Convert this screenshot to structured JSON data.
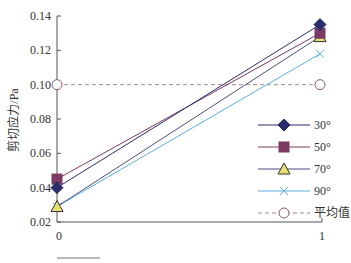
{
  "chart_data": {
    "type": "line",
    "title": "",
    "xlabel": "",
    "ylabel": "剪切应力/Pa",
    "x": [
      0,
      1
    ],
    "xticks": [
      "0",
      "1"
    ],
    "yticks": [
      "0.02",
      "0.04",
      "0.06",
      "0.08",
      "0.10",
      "0.12",
      "0.14"
    ],
    "ylim": [
      0.02,
      0.14
    ],
    "grid": false,
    "legend_position": "right-center",
    "series": [
      {
        "name": "30°",
        "values": [
          0.04,
          0.135
        ],
        "color": "#2b2d6b",
        "marker": "diamond",
        "marker_fill": "#2b2d6b",
        "line": "solid"
      },
      {
        "name": "50°",
        "values": [
          0.045,
          0.13
        ],
        "color": "#7a3a62",
        "marker": "square",
        "marker_fill": "#7a3a62",
        "line": "solid"
      },
      {
        "name": "70°",
        "values": [
          0.029,
          0.128
        ],
        "color": "#4a5080",
        "marker": "triangle",
        "marker_fill": "#e8e070",
        "line": "solid"
      },
      {
        "name": "90°",
        "values": [
          0.029,
          0.118
        ],
        "color": "#5aaee0",
        "marker": "x",
        "marker_fill": "none",
        "line": "solid"
      },
      {
        "name": "平均值",
        "values": [
          0.1,
          0.1
        ],
        "color": "#a08890",
        "marker": "circle-open",
        "marker_fill": "#ffffff",
        "line": "dashed"
      }
    ]
  }
}
